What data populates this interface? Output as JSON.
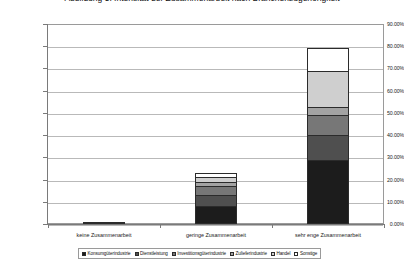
{
  "title": {
    "text": "Abbildung 5: Intensität der Zusammenarbeit nach Branchenzugehörigkeit"
  },
  "axes": {
    "y_ticks": [
      "90.00%",
      "80.00%",
      "70.00%",
      "60.00%",
      "50.00%",
      "40.00%",
      "30.00%",
      "20.00%",
      "10.00%",
      "0.00%"
    ],
    "y_min_label": "0.00%",
    "y_max_label": "90.00%"
  },
  "legend": {
    "position": "bottom",
    "items": [
      {
        "label": "Konsumgüterindustrie",
        "color": "#1c1c1c"
      },
      {
        "label": "Dienstleistung",
        "color": "#4f4f4f"
      },
      {
        "label": "Investitionsgüterindustrie",
        "color": "#777777"
      },
      {
        "label": "Zulieferindustrie",
        "color": "#a3a3a3"
      },
      {
        "label": "Handel",
        "color": "#cfcfcf"
      },
      {
        "label": "Sonstige",
        "color": "#ffffff"
      }
    ]
  },
  "chart_data": {
    "type": "bar",
    "subtype": "stacked-column",
    "title": "Abbildung 5: Intensität der Zusammenarbeit nach Branchenzugehörigkeit",
    "xlabel": "",
    "ylabel": "",
    "ylim": [
      0,
      90
    ],
    "ytick_step": 10,
    "ytick_format": "percent",
    "grid": true,
    "legend_position": "bottom",
    "categories": [
      "keine Zusammenarbeit",
      "geringe Zusammenarbeit",
      "sehr enge Zusammenarbeit"
    ],
    "series": [
      {
        "name": "Konsumgüterindustrie",
        "color": "#1c1c1c",
        "values": [
          1.0,
          8.0,
          29.0
        ]
      },
      {
        "name": "Dienstleistung",
        "color": "#4f4f4f",
        "values": [
          0.0,
          5.0,
          11.0
        ]
      },
      {
        "name": "Investitionsgüterindustrie",
        "color": "#777777",
        "values": [
          0.0,
          4.0,
          9.0
        ]
      },
      {
        "name": "Zulieferindustrie",
        "color": "#a3a3a3",
        "values": [
          0.0,
          2.0,
          3.5
        ]
      },
      {
        "name": "Handel",
        "color": "#cfcfcf",
        "values": [
          0.0,
          2.0,
          16.5
        ]
      },
      {
        "name": "Sonstige",
        "color": "#ffffff",
        "values": [
          0.0,
          2.0,
          10.0
        ]
      }
    ],
    "totals": [
      1.0,
      23.0,
      79.0
    ]
  }
}
